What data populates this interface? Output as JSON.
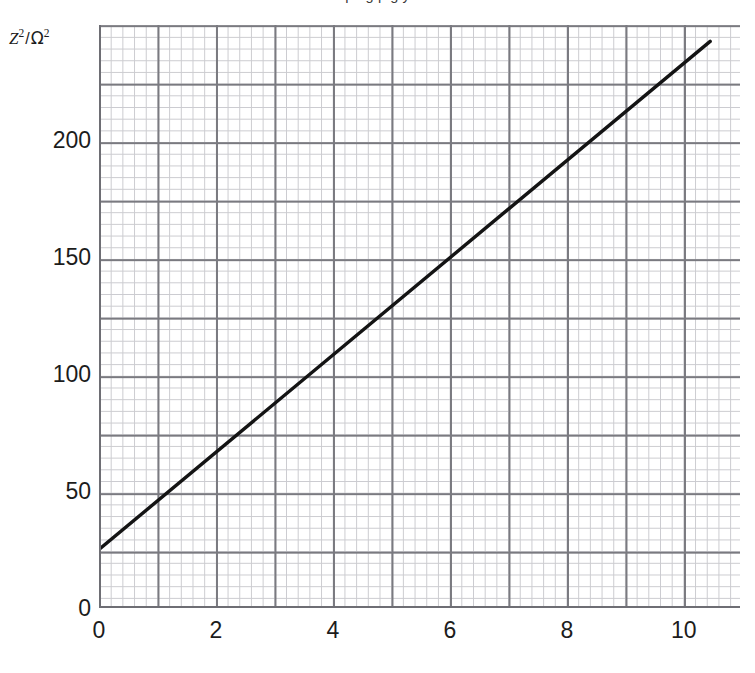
{
  "top_partial_text": "pe  g p   g    y",
  "axes": {
    "y_label_var": "Z",
    "y_label_var_sup": "2",
    "y_label_sep": "/",
    "y_label_unit": "Ω",
    "y_label_unit_sup": "2",
    "y_label_full": "Z² / Ω²",
    "x_label": ""
  },
  "chart_data": {
    "type": "line",
    "title": "",
    "xlabel": "",
    "ylabel": "Z² / Ω²",
    "xlim": [
      0,
      10.96
    ],
    "ylim": [
      0,
      249
    ],
    "xticks": [
      0,
      2,
      4,
      6,
      8,
      10
    ],
    "xtick_labels": [
      "0",
      "2",
      "4",
      "6",
      "8",
      "10"
    ],
    "yticks": [
      0,
      50,
      100,
      150,
      200
    ],
    "ytick_labels": [
      "0",
      "50",
      "100",
      "150",
      "200"
    ],
    "grid": true,
    "grid_major_step_x": 1,
    "grid_major_step_y": 25,
    "grid_minor_per_major": 5,
    "legend": false,
    "series": [
      {
        "name": "best-fit line",
        "style": "solid",
        "color": "#141414",
        "width": 3,
        "x": [
          0,
          10.45
        ],
        "values": [
          25,
          242
        ],
        "intercept": 25,
        "slope": 20.8,
        "points_through": [
          {
            "x": 0,
            "y": 25
          },
          {
            "x": 2,
            "y": 67
          },
          {
            "x": 4,
            "y": 108
          },
          {
            "x": 6,
            "y": 150
          },
          {
            "x": 8,
            "y": 192
          },
          {
            "x": 10,
            "y": 233
          }
        ]
      }
    ]
  },
  "colors": {
    "line": "#141414",
    "grid_minor": "#c3c3c8",
    "grid_major": "#7a7a80",
    "axis": "#6e6e74",
    "text": "#1c1c1c",
    "background": "#ffffff"
  }
}
